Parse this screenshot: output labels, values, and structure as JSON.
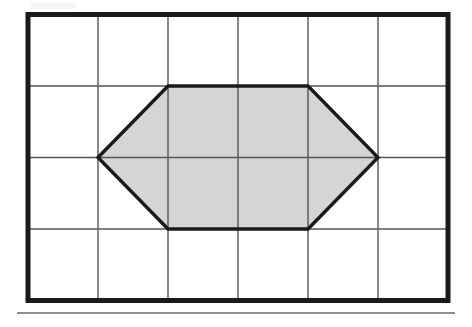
{
  "figure": {
    "title": "Shaded hexagon on a rectangular grid",
    "caption": "",
    "background_color": "#ffffff"
  },
  "chart_data": {
    "type": "diagram",
    "title": "Shaded hexagon on a rectangular grid",
    "xlabel": "",
    "ylabel": "",
    "grid": {
      "columns": 6,
      "rows": 4,
      "cell_width_px": 70,
      "cell_height_px": 71.5,
      "origin_px": [
        28,
        14.5
      ],
      "x_tick_values": [
        0,
        1,
        2,
        3,
        4,
        5,
        6
      ],
      "y_tick_values": [
        0,
        1,
        2,
        3,
        4
      ],
      "grid_on": true,
      "inner_line_color": "#555555",
      "inner_line_width_px": 1.4,
      "border_color": "#1a1a1a",
      "border_width_px": 5
    },
    "shapes": [
      {
        "name": "hexagon",
        "kind": "polygon",
        "sides": 6,
        "fill_color": "#d5d5d5",
        "stroke_color": "#1a1a1a",
        "stroke_width_px": 3.4,
        "vertices_grid": [
          [
            1,
            2
          ],
          [
            2,
            1
          ],
          [
            4,
            1
          ],
          [
            5,
            2
          ],
          [
            4,
            3
          ],
          [
            2,
            3
          ]
        ],
        "vertices_px": [
          [
            98,
            157.5
          ],
          [
            168,
            86
          ],
          [
            308,
            86
          ],
          [
            378,
            157.5
          ],
          [
            308,
            229
          ],
          [
            168,
            229
          ]
        ],
        "area_grid_squares": 6,
        "width_grid_units": 4,
        "height_grid_units": 2
      }
    ],
    "annotations": [],
    "legend": null,
    "rule": {
      "name": "bottom-rule",
      "x_start_px": 17,
      "x_end_px": 455,
      "y_px": 313,
      "color": "#6b6b6b",
      "thickness_px": 1.6
    }
  }
}
